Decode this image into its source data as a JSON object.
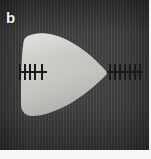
{
  "figure": {
    "panel_label": "b",
    "background_color": "#3b3b3b",
    "specimen_color": "#c9c9c4",
    "annotation_color": "#1a1a1a",
    "label_color": "#f2f2f2",
    "frame_color": "#f6f6f6",
    "width": 151,
    "height": 159
  },
  "specimen": {
    "name": "rounded-triangular-specimen",
    "description": "rounded triangular cross-section, apex pointing right",
    "fill": "#c9c9c4",
    "edge_highlight": "#d6d6d1",
    "edge_shadow": "#9c9c97"
  },
  "annotations": {
    "rulers": [
      {
        "name": "left-measurement-ruler",
        "position": "left",
        "tick_count": 5,
        "tick_offsets": [
          0,
          5,
          10,
          15,
          22
        ],
        "line_length": 28
      },
      {
        "name": "right-measurement-ruler",
        "position": "right",
        "tick_count": 7,
        "tick_offsets": [
          2,
          7,
          12,
          17,
          22,
          27,
          32
        ],
        "line_length": 36
      }
    ]
  }
}
